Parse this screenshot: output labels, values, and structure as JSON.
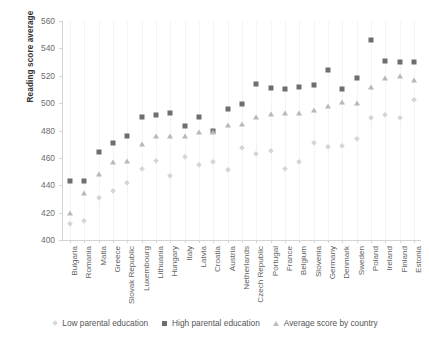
{
  "chart_data": {
    "type": "scatter",
    "title": "",
    "xlabel": "",
    "ylabel": "Reading score average",
    "ylim": [
      400,
      560
    ],
    "ytick_step": 20,
    "yticks": [
      400,
      420,
      440,
      460,
      480,
      500,
      520,
      540,
      560
    ],
    "grid": "vertical-light",
    "legend_position": "bottom",
    "categories": [
      "Bulgaria",
      "Romania",
      "Malta",
      "Greece",
      "Slovak Republic",
      "Luxembourg",
      "Lithuania",
      "Hungary",
      "Italy",
      "Latvia",
      "Croatia",
      "Austria",
      "Netherlands",
      "Czech Republic",
      "Portugal",
      "France",
      "Belgium",
      "Slovenia",
      "Germany",
      "Denmark",
      "Sweden",
      "Poland",
      "Ireland",
      "Finland",
      "Estonia"
    ],
    "series": [
      {
        "name": "Low parental education",
        "marker": "diamond",
        "color": "#d5d5d5",
        "values": [
          412,
          414,
          431,
          436,
          442,
          452,
          458,
          447,
          461,
          455,
          457,
          451,
          467,
          463,
          465,
          452,
          457,
          471,
          468,
          469,
          474,
          489,
          491,
          489,
          502
        ]
      },
      {
        "name": "High parental education",
        "marker": "square",
        "color": "#6e6e6e",
        "values": [
          443,
          443,
          464,
          471,
          476,
          490,
          491,
          493,
          483,
          490,
          480,
          496,
          499,
          514,
          511,
          510,
          512,
          513,
          524,
          510,
          518,
          546,
          531,
          530,
          530
        ]
      },
      {
        "name": "Average score by country",
        "marker": "triangle",
        "color": "#b8b8b8",
        "values": [
          420,
          434,
          448,
          457,
          458,
          470,
          476,
          476,
          476,
          479,
          479,
          484,
          485,
          490,
          492,
          493,
          493,
          495,
          498,
          501,
          500,
          512,
          518,
          520,
          517
        ]
      }
    ]
  },
  "axis": {
    "y_label": "Reading score average"
  },
  "legend": {
    "items": [
      {
        "label": "Low parental education",
        "marker": "diamond"
      },
      {
        "label": "High parental education",
        "marker": "square"
      },
      {
        "label": "Average score by country",
        "marker": "triangle"
      }
    ]
  }
}
